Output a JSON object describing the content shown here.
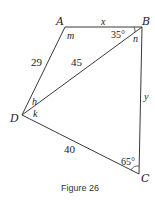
{
  "figure": {
    "caption": "Figure 26",
    "vertices": {
      "A": {
        "label": "A",
        "x": 65,
        "y": 27
      },
      "B": {
        "label": "B",
        "x": 142,
        "y": 27
      },
      "C": {
        "label": "C",
        "x": 139,
        "y": 174
      },
      "D": {
        "label": "D",
        "x": 22,
        "y": 115
      }
    },
    "sides": {
      "AB": "x",
      "AD": "29",
      "BD": "45",
      "BC": "y",
      "DC": "40"
    },
    "angles": {
      "A": "m",
      "B_top": "35°",
      "B_inner": "n",
      "D_upper": "h",
      "D_lower": "k",
      "C": "65°"
    },
    "colors": {
      "line": "#3a3a3a",
      "text": "#222222"
    }
  }
}
